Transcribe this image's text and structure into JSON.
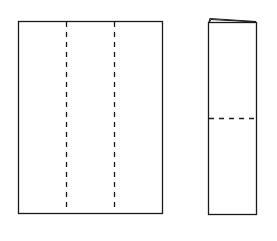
{
  "diagram": {
    "type": "paper-folding-steps",
    "stroke_color": "#1a1a1a",
    "background": "#ffffff",
    "panels": [
      {
        "name": "unfolded-sheet",
        "rect": {
          "x": 18,
          "y": 21,
          "w": 144,
          "h": 192
        },
        "fold_lines": [
          {
            "orientation": "vertical",
            "x": 66,
            "style": "dashed"
          },
          {
            "orientation": "vertical",
            "x": 114,
            "style": "dashed"
          }
        ]
      },
      {
        "name": "trifolded-sheet",
        "rect": {
          "x": 208,
          "y": 22,
          "w": 48,
          "h": 192
        },
        "fold_lines": [
          {
            "orientation": "horizontal",
            "y": 118,
            "style": "dashed"
          }
        ],
        "layered_top_edge": true
      }
    ]
  }
}
